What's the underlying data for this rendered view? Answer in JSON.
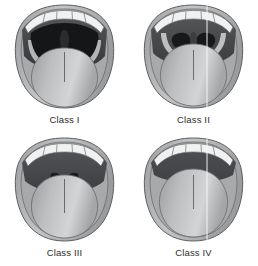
{
  "figure": {
    "background_color": "#ffffff",
    "layout": "2x2 grid",
    "panels": [
      {
        "id": "class-1",
        "label": "Class I",
        "visible_structures": "soft palate, fauces, uvula, tonsillar pillars",
        "pharynx_opening": "large",
        "uvula_visible": true,
        "midline_guide": false
      },
      {
        "id": "class-2",
        "label": "Class II",
        "visible_structures": "soft palate, fauces, uvula",
        "pharynx_opening": "partial",
        "uvula_visible": true,
        "midline_guide": true
      },
      {
        "id": "class-3",
        "label": "Class III",
        "visible_structures": "soft palate, base of uvula",
        "pharynx_opening": "narrow",
        "uvula_visible": false,
        "midline_guide": false
      },
      {
        "id": "class-4",
        "label": "Class IV",
        "visible_structures": "hard palate only",
        "pharynx_opening": "none",
        "uvula_visible": false,
        "midline_guide": true
      }
    ]
  },
  "colors": {
    "background": "#ffffff",
    "outline": "#58595b",
    "lip_outer": "#b9bbbd",
    "lip_inner": "#8d8f91",
    "cheek_shade": "#9a9c9e",
    "teeth": "#f2f2f2",
    "teeth_line": "#6e7072",
    "palate_dark": "#3a3b3d",
    "pharynx_black": "#161718",
    "uvula": "#2a2b2d",
    "tongue_light": "#d2d3d4",
    "tongue_mid": "#a8aaac",
    "tongue_dark": "#8a8c8e",
    "midline": "#5e6062",
    "guide_line": "#f8f8f8",
    "label_text": "#2b2b2b"
  }
}
